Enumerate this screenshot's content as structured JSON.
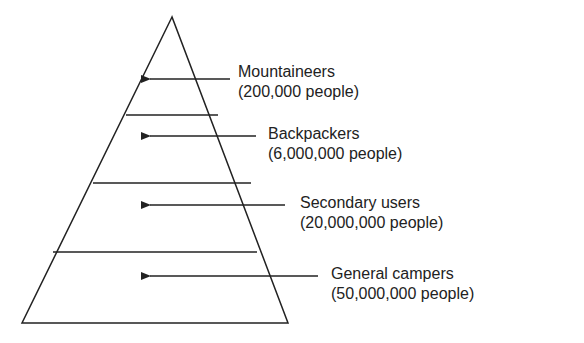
{
  "diagram": {
    "type": "pyramid",
    "tiers": [
      {
        "name": "Mountaineers",
        "count": "(200,000 people)"
      },
      {
        "name": "Backpackers",
        "count": "(6,000,000 people)"
      },
      {
        "name": "Secondary users",
        "count": "(20,000,000 people)"
      },
      {
        "name": "General campers",
        "count": "(50,000,000 people)"
      }
    ]
  }
}
